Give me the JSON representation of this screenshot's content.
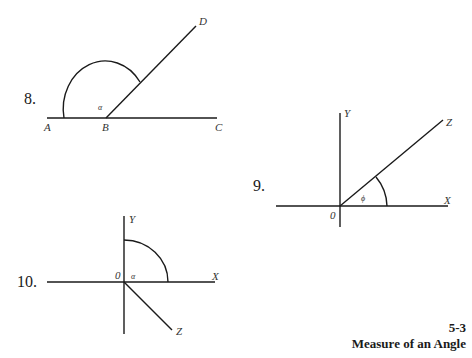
{
  "figures": [
    {
      "number": "8.",
      "points": {
        "A": "A",
        "B": "B",
        "C": "C",
        "D": "D"
      },
      "angle_symbol": "α"
    },
    {
      "number": "9.",
      "axes": {
        "x": "X",
        "y": "Y",
        "z": "Z",
        "origin": "0"
      },
      "angle_symbol": "ϕ"
    },
    {
      "number": "10.",
      "axes": {
        "x": "X",
        "y": "Y",
        "z": "Z",
        "origin": "0"
      },
      "angle_symbol": "α"
    }
  ],
  "caption": {
    "section": "5-3",
    "title": "Measure of an Angle"
  }
}
